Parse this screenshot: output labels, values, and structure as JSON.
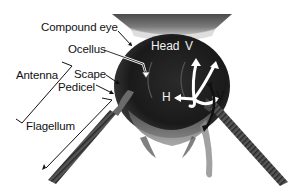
{
  "figure": {
    "labels": {
      "compound_eye": "Compound eye",
      "ocellus": "Ocellus",
      "head": "Head",
      "antenna": "Antenna",
      "scape": "Scape",
      "pedicel": "Pedicel",
      "flagellum": "Flagellum",
      "v_upper": "V",
      "v_right": "V",
      "h": "H"
    },
    "colors": {
      "background": "#ffffff",
      "label_dark": "#111111",
      "label_light": "#f2f2f2",
      "arrow_white": "#ffffff",
      "arrow_black": "#111111",
      "head_dark": "#1c1c1c"
    }
  }
}
